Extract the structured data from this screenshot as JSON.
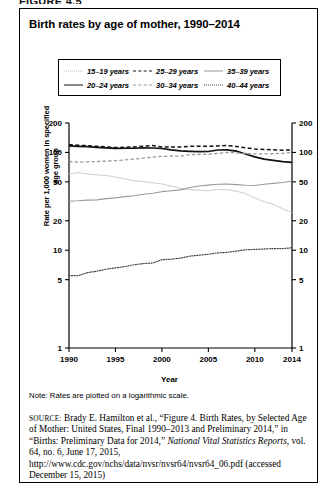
{
  "figure_header": "FIGURE 4.5",
  "title": "Birth rates by age of mother, 1990–2014",
  "axis": {
    "xlabel": "Year",
    "ylabel": "Rate per 1,000 women in specified age group"
  },
  "note": "Note: Rates are plotted on a logarithmic scale.",
  "source": {
    "label": "SOURCE:",
    "text": " Brady E. Hamilton et al., “Figure 4. Birth Rates, by Selected Age of Mother: United States, Final 1990–2013 and Preliminary 2014,” in “Births: Preliminary Data for 2014,” ",
    "italic": "National Vital Statistics Reports",
    "tail": ", vol. 64, no. 6, June 17, 2015, http://www.cdc.gov/nchs/data/nvsr/nvsr64/nvsr64_06.pdf (accessed December 15, 2015)"
  },
  "chart_data": {
    "type": "line",
    "title": "Birth rates by age of mother, 1990–2014",
    "xlabel": "Year",
    "ylabel": "Rate per 1,000 women in specified age group",
    "yscale": "log",
    "ylim": [
      1,
      200
    ],
    "ytick_values": [
      1,
      5,
      10,
      20,
      50,
      100,
      200
    ],
    "ytick_labels": [
      "1",
      "5",
      "10",
      "20",
      "50",
      "100",
      "200"
    ],
    "xlim": [
      1990,
      2014
    ],
    "xtick_values": [
      1990,
      1995,
      2000,
      2005,
      2010,
      2014
    ],
    "xtick_labels": [
      "1990",
      "1995",
      "2000",
      "2005",
      "2010",
      "2014"
    ],
    "grid": false,
    "legend_position": "top",
    "x": [
      1990,
      1991,
      1992,
      1993,
      1994,
      1995,
      1996,
      1997,
      1998,
      1999,
      2000,
      2001,
      2002,
      2003,
      2004,
      2005,
      2006,
      2007,
      2008,
      2009,
      2010,
      2011,
      2012,
      2013,
      2014
    ],
    "series": [
      {
        "name": "15–19 years",
        "style": "dotted",
        "color": "#bbbbbb",
        "width": 0.9,
        "values": [
          59.9,
          62.1,
          60.3,
          59.0,
          58.2,
          56.0,
          53.5,
          51.3,
          50.3,
          48.8,
          47.7,
          45.3,
          43.0,
          41.6,
          41.1,
          40.5,
          41.9,
          41.5,
          40.2,
          37.9,
          34.2,
          31.3,
          29.4,
          26.5,
          24.2
        ]
      },
      {
        "name": "20–24 years",
        "style": "solid",
        "color": "#111111",
        "width": 1.7,
        "values": [
          116.5,
          115.3,
          114.6,
          112.6,
          111.1,
          109.8,
          110.4,
          110.4,
          111.2,
          111.0,
          109.7,
          106.2,
          103.6,
          102.6,
          101.7,
          102.2,
          105.9,
          106.3,
          103.0,
          96.3,
          90.0,
          85.3,
          83.1,
          80.7,
          79.0
        ]
      },
      {
        "name": "25–29 years",
        "style": "dashed",
        "color": "#111111",
        "width": 1.5,
        "values": [
          120.2,
          118.2,
          117.4,
          115.5,
          113.9,
          112.2,
          113.1,
          113.8,
          115.9,
          117.8,
          113.5,
          113.4,
          113.6,
          115.6,
          115.5,
          115.5,
          116.7,
          117.5,
          115.1,
          111.5,
          108.3,
          107.2,
          106.5,
          105.5,
          105.8
        ]
      },
      {
        "name": "30–34 years",
        "style": "dashed",
        "color": "#9a9a9a",
        "width": 1.3,
        "values": [
          80.8,
          79.5,
          80.2,
          80.8,
          81.5,
          82.5,
          83.9,
          85.3,
          87.4,
          89.6,
          91.2,
          91.9,
          91.5,
          95.1,
          95.3,
          95.8,
          97.7,
          99.9,
          99.3,
          97.5,
          96.5,
          96.5,
          97.3,
          98.0,
          100.8
        ]
      },
      {
        "name": "35–39 years",
        "style": "solid",
        "color": "#9a9a9a",
        "width": 1.1,
        "values": [
          31.7,
          32.0,
          32.5,
          32.7,
          33.7,
          34.3,
          35.3,
          36.1,
          37.4,
          38.3,
          39.7,
          40.6,
          41.4,
          43.8,
          45.4,
          46.3,
          47.3,
          47.5,
          46.9,
          46.1,
          45.9,
          47.2,
          48.3,
          49.3,
          51.0
        ]
      },
      {
        "name": "40–44 years",
        "style": "dotted",
        "color": "#444444",
        "width": 1.2,
        "values": [
          5.5,
          5.5,
          5.9,
          6.1,
          6.4,
          6.6,
          6.8,
          7.1,
          7.3,
          7.4,
          8.0,
          8.1,
          8.3,
          8.7,
          8.9,
          9.1,
          9.4,
          9.5,
          9.8,
          10.1,
          10.2,
          10.3,
          10.4,
          10.4,
          10.6
        ]
      }
    ]
  }
}
